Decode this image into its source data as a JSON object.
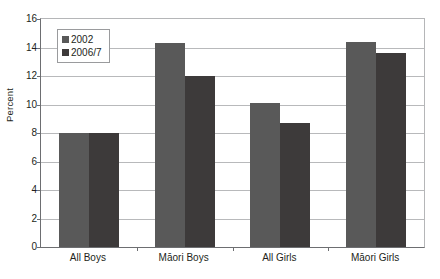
{
  "chart_data": {
    "type": "bar",
    "title": "",
    "subtitle": "",
    "xlabel": "",
    "ylabel": "Percent",
    "categories": [
      "All Boys",
      "Māori Boys",
      "All Girls",
      "Māori Girls"
    ],
    "series": [
      {
        "name": "2002",
        "color": "#595959",
        "values": [
          8.0,
          14.3,
          10.1,
          14.4
        ]
      },
      {
        "name": "2006/7",
        "color": "#3d3a3a",
        "values": [
          8.0,
          12.0,
          8.7,
          13.6
        ]
      }
    ],
    "ylim": [
      0,
      16
    ],
    "ytick_values": [
      0,
      2,
      4,
      6,
      8,
      10,
      12,
      14,
      16
    ],
    "ytick_labels": [
      "0",
      "2",
      "4",
      "6",
      "8",
      "10",
      "12",
      "14",
      "16"
    ],
    "grid": true,
    "legend_position": "upper left",
    "annotations": []
  },
  "legend": {
    "entries": [
      {
        "label": "2002"
      },
      {
        "label": "2006/7"
      }
    ]
  }
}
